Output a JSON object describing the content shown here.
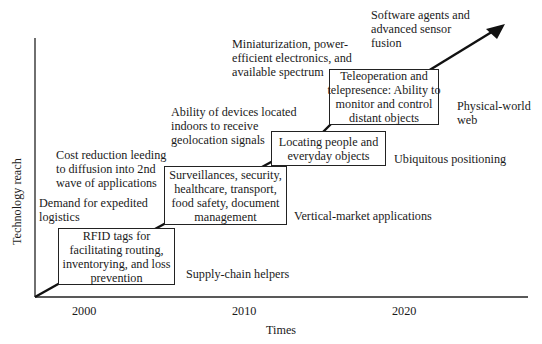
{
  "axes": {
    "y_label": "Technology reach",
    "x_label": "Times",
    "x_ticks": [
      "2000",
      "2010",
      "2020"
    ]
  },
  "stages": [
    {
      "box": "RFID tags for\nfacilitating routing,\ninventorying, and loss\nprevention",
      "driver": "Demand for expedited\nlogistics",
      "phase": "Supply-chain helpers"
    },
    {
      "box": "Surveillances, security,\nhealthcare, transport,\nfood safety, document\nmanagement",
      "driver": "Cost reduction leeding\nto diffusion into 2nd\nwave of applications",
      "phase": "Vertical-market applications"
    },
    {
      "box": "Locating people and\neveryday objects",
      "driver": "Ability of devices located\nindoors to receive\ngeolocation signals",
      "phase": "Ubiquitous positioning"
    },
    {
      "box": "Teleoperation and\ntelepresence: Ability to\nmonitor and control\ndistant objects",
      "driver": "Miniaturization, power-\nefficient electronics, and\navailable spectrum",
      "phase": "Physical-world\nweb"
    },
    {
      "box": "",
      "driver": "Software agents and\nadvanced sensor\nfusion",
      "phase": ""
    }
  ],
  "colors": {
    "line": "#1a1a1a",
    "text": "#1a1a1a",
    "background": "#ffffff"
  }
}
